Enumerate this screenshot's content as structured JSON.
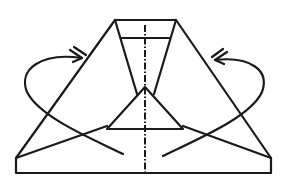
{
  "diagram": {
    "kind": "origami-fold-step",
    "description": "Fold both outer flaps behind along the slanted edges (valley/mountain fold arrows), symmetric about the centre dash-dot line",
    "colors": {
      "line": "#1a1a1a",
      "background": "#ffffff"
    },
    "elements": {
      "top_edge": {
        "x1": 115,
        "y1": 20,
        "x2": 176,
        "y2": 20
      },
      "inner_horizontal": {
        "x1": 121,
        "y1": 38,
        "x2": 170,
        "y2": 38
      },
      "center_line": {
        "x": 145,
        "y1": 25,
        "y2": 175,
        "style": "dash-dot"
      },
      "left_arrow": {
        "direction": "fold-behind",
        "head": "double-chevron"
      },
      "right_arrow": {
        "direction": "fold-behind",
        "head": "double-chevron"
      }
    }
  }
}
